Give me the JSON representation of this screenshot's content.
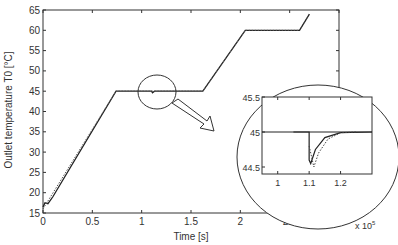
{
  "chart_data": {
    "type": "line",
    "title": "",
    "xlabel": "Time [s]",
    "ylabel": "Outlet temperature T0 [°C]",
    "x_multiplier": "x 10^5",
    "xlim": [
      0,
      3
    ],
    "ylim": [
      15,
      65
    ],
    "xticks": [
      "0",
      "0.5",
      "1",
      "1.5",
      "2",
      "2.5",
      "3"
    ],
    "yticks": [
      "15",
      "20",
      "25",
      "30",
      "35",
      "40",
      "45",
      "50",
      "55",
      "60",
      "65"
    ],
    "grid": false,
    "series": [
      {
        "name": "outlet temperature",
        "style": "solid",
        "x": [
          0,
          0.02,
          0.05,
          0.1,
          0.74,
          1.1,
          1.11,
          1.13,
          1.62,
          2.05,
          2.6,
          2.7
        ],
        "y": [
          16.5,
          17.5,
          17.3,
          19,
          45,
          45,
          44.6,
          45,
          45,
          60,
          60,
          64
        ]
      },
      {
        "name": "reference (dotted)",
        "style": "dotted",
        "x": [
          0,
          0.74,
          1.62,
          2.05,
          2.6,
          2.7
        ],
        "y": [
          16,
          45,
          45,
          60,
          60,
          64
        ]
      }
    ],
    "inset": {
      "xticks": [
        "1",
        "1.1",
        "1.2"
      ],
      "yticks": [
        "44.5",
        "45",
        "45.5"
      ],
      "ylim": [
        44.4,
        45.5
      ],
      "series": [
        {
          "name": "solid",
          "x": [
            1.05,
            1.1,
            1.1,
            1.105,
            1.12,
            1.15,
            1.2,
            1.3
          ],
          "y": [
            45,
            45,
            44.6,
            44.55,
            44.75,
            44.92,
            44.99,
            45
          ]
        },
        {
          "name": "dotted",
          "x": [
            1.1,
            1.115,
            1.13,
            1.16,
            1.2,
            1.25
          ],
          "y": [
            44.8,
            44.5,
            44.7,
            44.9,
            44.99,
            45
          ]
        }
      ],
      "annotation": "circled zoom of disturbance near t=1.1 x 10^5 s"
    }
  }
}
